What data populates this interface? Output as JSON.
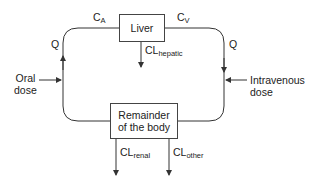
{
  "diagram": {
    "type": "pharmacokinetic-compartment-model",
    "nodes": {
      "liver": {
        "label": "Liver"
      },
      "remainder": {
        "label_line1": "Remainder",
        "label_line2": "of the body"
      }
    },
    "flows": {
      "arterial": {
        "base": "C",
        "sub": "A"
      },
      "venous": {
        "base": "C",
        "sub": "V"
      },
      "q_left": "Q",
      "q_right": "Q"
    },
    "clearances": {
      "hepatic": {
        "base": "CL",
        "sub": "hepatic"
      },
      "renal": {
        "base": "CL",
        "sub": "renal"
      },
      "other": {
        "base": "CL",
        "sub": "other"
      }
    },
    "inputs": {
      "oral": {
        "line1": "Oral",
        "line2": "dose"
      },
      "iv": {
        "line1": "Intravenous",
        "line2": "dose"
      }
    },
    "colors": {
      "line": "#333333",
      "text": "#222222"
    }
  }
}
